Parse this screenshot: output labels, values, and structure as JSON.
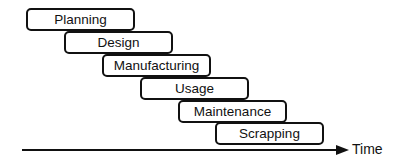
{
  "diagram": {
    "phases": [
      {
        "label": "Planning"
      },
      {
        "label": "Design"
      },
      {
        "label": "Manufacturing"
      },
      {
        "label": "Usage"
      },
      {
        "label": "Maintenance"
      },
      {
        "label": "Scrapping"
      }
    ],
    "axis": {
      "label": "Time"
    }
  }
}
